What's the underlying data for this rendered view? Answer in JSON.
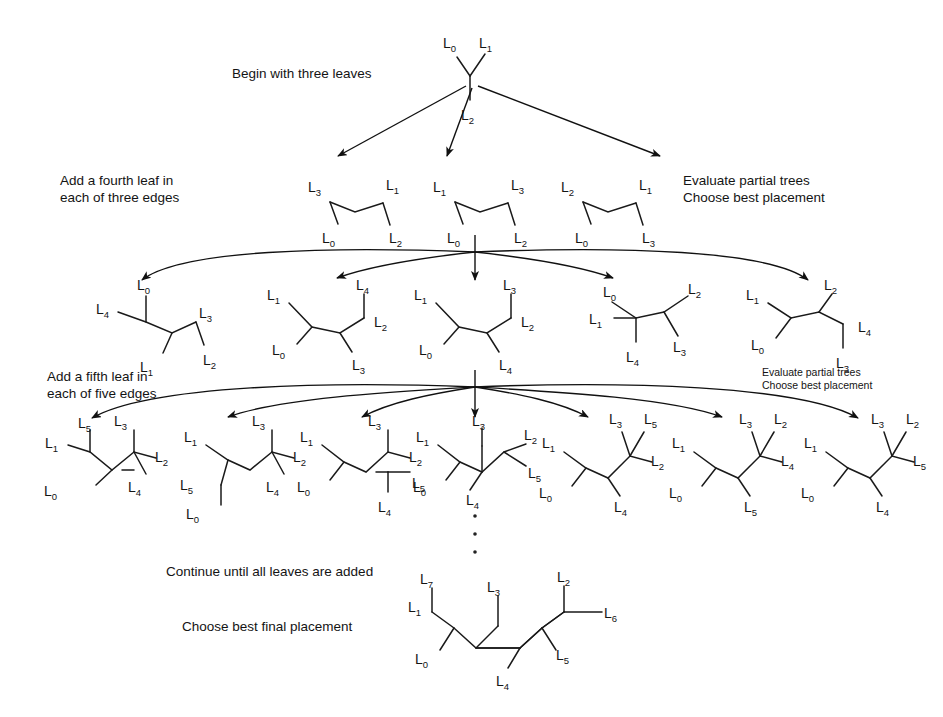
{
  "diagram": {
    "background": "#ffffff",
    "line_color": "#1a1a1a",
    "captions": {
      "begin": "Begin with three leaves",
      "add_fourth": "Add a fourth leaf in\neach of three edges",
      "evaluate_1": "Evaluate partial trees\nChoose best placement",
      "add_fifth": "Add a fifth leaf in\neach of five edges",
      "evaluate_2": "Evaluate partial trees\nChoose best placement",
      "continue": "Continue until all leaves are added",
      "final": "Choose best final placement"
    },
    "leaf_prefix": "L",
    "rows": [
      {
        "name": "row-three-leaves",
        "count": 1,
        "trees": [
          {
            "name": "tree-3-leaf",
            "leaves": [
              "L0",
              "L1",
              "L2"
            ]
          }
        ]
      },
      {
        "name": "row-four-leaves",
        "count": 3,
        "trees": [
          {
            "name": "tree-4a",
            "leaves": [
              "L3",
              "L1",
              "L0",
              "L2"
            ]
          },
          {
            "name": "tree-4b",
            "leaves": [
              "L1",
              "L3",
              "L0",
              "L2"
            ]
          },
          {
            "name": "tree-4c",
            "leaves": [
              "L2",
              "L1",
              "L0",
              "L3"
            ]
          }
        ]
      },
      {
        "name": "row-five-leaves",
        "count": 5,
        "trees": [
          {
            "name": "tree-5a",
            "leaves": [
              "L0",
              "L4",
              "L1",
              "L3",
              "L2"
            ]
          },
          {
            "name": "tree-5b",
            "leaves": [
              "L4",
              "L1",
              "L0",
              "L2",
              "L3"
            ]
          },
          {
            "name": "tree-5c",
            "leaves": [
              "L3",
              "L1",
              "L0",
              "L2",
              "L4"
            ]
          },
          {
            "name": "tree-5d",
            "leaves": [
              "L0",
              "L2",
              "L1",
              "L3",
              "L4"
            ]
          },
          {
            "name": "tree-5e",
            "leaves": [
              "L2",
              "L1",
              "L0",
              "L4",
              "L3"
            ]
          }
        ]
      },
      {
        "name": "row-six-leaves",
        "count": 7,
        "trees": [
          {
            "name": "tree-6a",
            "leaves": [
              "L5",
              "L3",
              "L1",
              "L2",
              "L0",
              "L4"
            ]
          },
          {
            "name": "tree-6b",
            "leaves": [
              "L3",
              "L1",
              "L2",
              "L5",
              "L4",
              "L0"
            ]
          },
          {
            "name": "tree-6c",
            "leaves": [
              "L3",
              "L1",
              "L2",
              "L0",
              "L5",
              "L4"
            ]
          },
          {
            "name": "tree-6d",
            "leaves": [
              "L3",
              "L1",
              "L2",
              "L0",
              "L5",
              "L4"
            ]
          },
          {
            "name": "tree-6e",
            "leaves": [
              "L3",
              "L5",
              "L1",
              "L2",
              "L0",
              "L4"
            ]
          },
          {
            "name": "tree-6f",
            "leaves": [
              "L3",
              "L2",
              "L1",
              "L4",
              "L0",
              "L5"
            ]
          },
          {
            "name": "tree-6g",
            "leaves": [
              "L3",
              "L2",
              "L1",
              "L5",
              "L0",
              "L4"
            ]
          }
        ]
      },
      {
        "name": "row-final-tree",
        "count": 1,
        "trees": [
          {
            "name": "tree-final",
            "leaves": [
              "L7",
              "L3",
              "L2",
              "L1",
              "L6",
              "L0",
              "L5",
              "L4"
            ]
          }
        ]
      }
    ],
    "ellipsis": {
      "name": "vertical-ellipsis",
      "dots": 3
    },
    "arrow_fans": [
      {
        "name": "fan-row1-to-row2",
        "arrows": 3
      },
      {
        "name": "fan-row2-to-row3",
        "arrows": 5
      },
      {
        "name": "fan-row3-to-row4",
        "arrows": 7
      }
    ]
  }
}
